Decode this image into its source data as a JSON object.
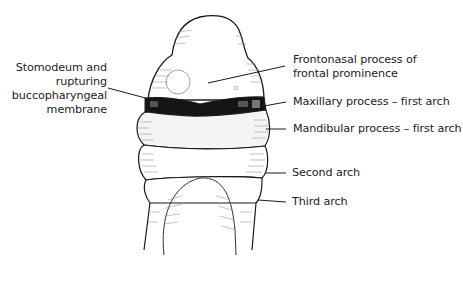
{
  "figure": {
    "labels": {
      "stomodeum": [
        "Stomodeum and",
        "rupturing",
        "buccopharyngeal",
        "membrane"
      ],
      "frontonasal": [
        "Frontonasal process of",
        "frontal prominence"
      ],
      "maxillary": "Maxillary process – first arch",
      "mandibular": "Mandibular process – first arch",
      "second_arch": "Second arch",
      "third_arch": "Third arch"
    },
    "colors": {
      "outline": "#1a1a1a",
      "hatching": "#8a8a8a",
      "stomodeum_fill": "#151515",
      "background": "#ffffff"
    }
  }
}
